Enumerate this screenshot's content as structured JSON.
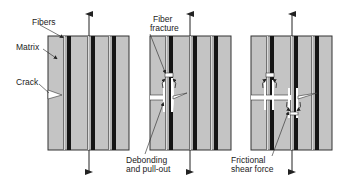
{
  "figure": {
    "colors": {
      "matrix": "#c4c4c4",
      "fiber_dark": "#151515",
      "fiber_light": "#dadada",
      "outline": "#333333",
      "background": "#ffffff"
    }
  },
  "labels": {
    "fibers": "Fibers",
    "matrix": "Matrix",
    "crack": "Crack",
    "fiber_fracture_1": "Fiber",
    "fiber_fracture_2": "fracture",
    "debonding_1": "Debonding",
    "debonding_2": "and pull-out",
    "frictional_1": "Frictional",
    "frictional_2": "shear force"
  },
  "panels": [
    {
      "id": 1,
      "name": "Crack approaching fibers",
      "x": 48,
      "width": 81
    },
    {
      "id": 2,
      "name": "Fiber fracture, debonding and pull-out",
      "x": 150,
      "width": 81
    },
    {
      "id": 3,
      "name": "Frictional shear force",
      "x": 251,
      "width": 81
    }
  ]
}
